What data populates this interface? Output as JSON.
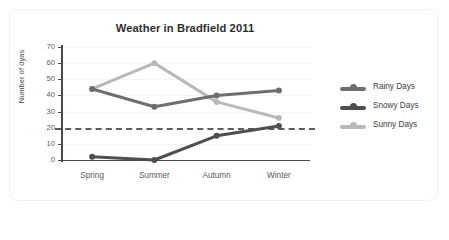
{
  "card": {
    "name": "chart-card"
  },
  "chart_data": {
    "type": "line",
    "title": "Weather in Bradfield 2011",
    "xlabel": "",
    "ylabel": "Number of dyas",
    "categories": [
      "Spring",
      "Summer",
      "Autumn",
      "Winter"
    ],
    "ylim": [
      0,
      70
    ],
    "yticks": [
      0,
      10,
      20,
      30,
      40,
      50,
      60,
      70
    ],
    "grid": true,
    "legend_position": "right",
    "series": [
      {
        "name": "Rainy Days",
        "values": [
          44,
          33,
          40,
          43
        ],
        "color": "#6e6e6e"
      },
      {
        "name": "Snowy Days",
        "values": [
          2,
          0,
          15,
          21
        ],
        "color": "#4f4f4f"
      },
      {
        "name": "Sunny Days",
        "values": [
          44,
          60,
          36,
          26
        ],
        "color": "#b9b9b9"
      }
    ],
    "annotations": [
      {
        "type": "reference-line",
        "axis": "y",
        "value": 20,
        "style": "dashed",
        "color": "#5c5c5c"
      }
    ]
  },
  "legend": {
    "items": [
      {
        "label": "Rainy Days"
      },
      {
        "label": "Snowy Days"
      },
      {
        "label": "Sunny Days"
      }
    ]
  }
}
